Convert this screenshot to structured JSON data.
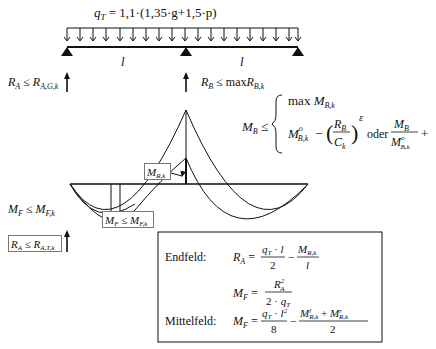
{
  "load": {
    "formula_lhs": "q",
    "formula_lhs_sub": "T",
    "formula_rhs": " = 1,1·(1,35·g+1,5·p)"
  },
  "spans": {
    "left_label": "l",
    "right_label": "l"
  },
  "reactions": {
    "ra_upper": "R_A ≤ R_A,G,k",
    "rb": "R_B ≤ maxR_B,k",
    "mf_left": "M_F ≤ M_F,k",
    "ra_lower_boxed": "R_A ≤ R_A,T,k"
  },
  "moment_labels": {
    "mrk_boxed": "M_R,k",
    "mf_boxed": "M_F ≤ M_F,k"
  },
  "mb_condition": {
    "lhs": "M_B ≤",
    "line1": "max M_B,k",
    "line2_left": "M°_B,k − (R_B / C_k)^ε",
    "connector": "oder",
    "line2_right": "M_B / M°_B,k + (R_B / R°_B,k)^ε ≤ 1"
  },
  "formula_box": {
    "endfeld_label": "Endfeld:",
    "endfeld_ra": "R_A = q_T·l/2 − M_R,k/l",
    "endfeld_mf": "M_F = R_A² / (2·q_T)",
    "mittelfeld_label": "Mittelfeld:",
    "mittelfeld_mf": "M_F = q_T·l²/8 − (M^l_R,k + M^r_R,k)/2"
  },
  "colors": {
    "ink": "#111111",
    "box_border": "#777777",
    "background": "#ffffff"
  }
}
